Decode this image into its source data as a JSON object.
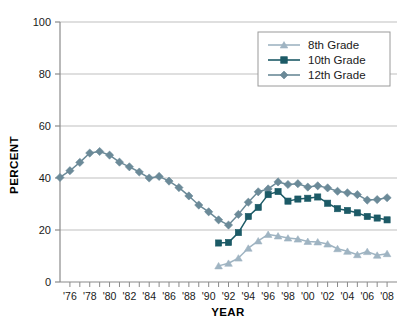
{
  "chart_data": {
    "type": "line",
    "title": "",
    "xlabel": "YEAR",
    "ylabel": "PERCENT",
    "ylim": [
      0,
      100
    ],
    "yticks": [
      0,
      20,
      40,
      60,
      80,
      100
    ],
    "xlim": [
      1975,
      2009
    ],
    "xticks": [
      1976,
      1978,
      1980,
      1982,
      1984,
      1986,
      1988,
      1990,
      1992,
      1994,
      1996,
      1998,
      2000,
      2002,
      2004,
      2006,
      2008
    ],
    "xtick_labels": [
      "'76",
      "'78",
      "'80",
      "'82",
      "'84",
      "'86",
      "'88",
      "'90",
      "'92",
      "'94",
      "'96",
      "'98",
      "'00",
      "'02",
      "'04",
      "'06",
      "'08"
    ],
    "grid": "horizontal",
    "legend_position": "top-right",
    "series": [
      {
        "name": "8th Grade",
        "marker": "triangle",
        "color": "#9fb4c2",
        "x": [
          1991,
          1992,
          1993,
          1994,
          1995,
          1996,
          1997,
          1998,
          1999,
          2000,
          2001,
          2002,
          2003,
          2004,
          2005,
          2006,
          2007,
          2008
        ],
        "values": [
          6.2,
          7.2,
          9.2,
          13.0,
          15.8,
          18.3,
          17.7,
          16.9,
          16.5,
          15.6,
          15.4,
          14.6,
          12.8,
          11.8,
          10.5,
          11.7,
          10.3,
          10.9
        ]
      },
      {
        "name": "10th Grade",
        "marker": "square",
        "color": "#1c5a66",
        "x": [
          1991,
          1992,
          1993,
          1994,
          1995,
          1996,
          1997,
          1998,
          1999,
          2000,
          2001,
          2002,
          2003,
          2004,
          2005,
          2006,
          2007,
          2008
        ],
        "values": [
          15.0,
          15.2,
          19.0,
          25.2,
          28.7,
          33.6,
          34.8,
          31.1,
          31.9,
          32.2,
          32.7,
          30.3,
          28.2,
          27.5,
          26.6,
          25.2,
          24.6,
          23.9
        ]
      },
      {
        "name": "12th Grade",
        "marker": "diamond",
        "color": "#6b8a98",
        "x": [
          1975,
          1976,
          1977,
          1978,
          1979,
          1980,
          1981,
          1982,
          1983,
          1984,
          1985,
          1986,
          1987,
          1988,
          1989,
          1990,
          1991,
          1992,
          1993,
          1994,
          1995,
          1996,
          1997,
          1998,
          1999,
          2000,
          2001,
          2002,
          2003,
          2004,
          2005,
          2006,
          2007,
          2008
        ],
        "values": [
          40.2,
          42.8,
          46.0,
          49.6,
          50.2,
          48.8,
          46.1,
          44.3,
          42.3,
          40.0,
          40.6,
          38.8,
          36.3,
          33.1,
          29.6,
          27.0,
          23.9,
          21.9,
          26.0,
          30.7,
          34.7,
          35.8,
          38.5,
          37.5,
          37.8,
          36.5,
          37.0,
          36.2,
          34.9,
          34.3,
          33.6,
          31.5,
          31.7,
          32.4
        ]
      }
    ]
  },
  "legend": {
    "entries": [
      {
        "label": "8th Grade"
      },
      {
        "label": "10th Grade"
      },
      {
        "label": "12th Grade"
      }
    ]
  },
  "colors": {
    "grade8": "#9fb4c2",
    "grade10": "#1c5a66",
    "grade12": "#6b8a98",
    "axis": "#8a8a8a",
    "grid": "#bfbfbf",
    "text": "#1a1a1a"
  }
}
